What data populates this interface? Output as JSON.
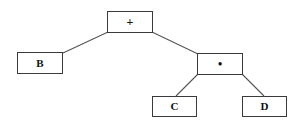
{
  "diagram": {
    "type": "expression-tree",
    "colors": {
      "background": "#ffffff",
      "border": "#3a3a3a",
      "edge": "#555555",
      "text": "#111111"
    },
    "nodes": [
      {
        "id": "plus",
        "label": "+",
        "x": 107,
        "y": 11,
        "w": 46,
        "h": 22,
        "kind": "op"
      },
      {
        "id": "b",
        "label": "B",
        "x": 17,
        "y": 52,
        "w": 46,
        "h": 22,
        "kind": "leaf"
      },
      {
        "id": "times",
        "label": "•",
        "x": 197,
        "y": 53,
        "w": 46,
        "h": 22,
        "kind": "op"
      },
      {
        "id": "c",
        "label": "C",
        "x": 152,
        "y": 96,
        "w": 45,
        "h": 21,
        "kind": "leaf"
      },
      {
        "id": "d",
        "label": "D",
        "x": 242,
        "y": 96,
        "w": 45,
        "h": 21,
        "kind": "leaf"
      }
    ],
    "edges": [
      {
        "from": "plus",
        "to": "b",
        "x1": 108,
        "y1": 32,
        "x2": 63,
        "y2": 53
      },
      {
        "from": "plus",
        "to": "times",
        "x1": 152,
        "y1": 32,
        "x2": 198,
        "y2": 54
      },
      {
        "from": "times",
        "to": "c",
        "x1": 198,
        "y1": 74,
        "x2": 176,
        "y2": 96
      },
      {
        "from": "times",
        "to": "d",
        "x1": 242,
        "y1": 74,
        "x2": 264,
        "y2": 96
      }
    ]
  }
}
